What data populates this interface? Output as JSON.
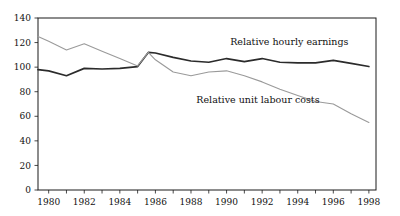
{
  "chart_data": {
    "type": "line",
    "title": "",
    "xlabel": "",
    "ylabel": "",
    "xlim": [
      1979.4,
      1998.4
    ],
    "ylim": [
      0,
      140
    ],
    "grid": false,
    "legend_position": "inline-annotations",
    "yticks": [
      0,
      20,
      40,
      60,
      80,
      100,
      120,
      140
    ],
    "ytick_labels": [
      "0",
      "20",
      "40",
      "60",
      "80",
      "100",
      "120",
      "140"
    ],
    "xticks": [
      1980,
      1981,
      1982,
      1983,
      1984,
      1985,
      1986,
      1987,
      1988,
      1989,
      1990,
      1991,
      1992,
      1993,
      1994,
      1995,
      1996,
      1997,
      1998
    ],
    "xtick_labels_shown": [
      "1980",
      "1982",
      "1984",
      "1986",
      "1988",
      "1990",
      "1992",
      "1994",
      "1996",
      "1998"
    ],
    "x": [
      1979.4,
      1980,
      1981,
      1982,
      1983,
      1984,
      1985,
      1985.6,
      1986,
      1987,
      1988,
      1989,
      1990,
      1991,
      1992,
      1993,
      1994,
      1995,
      1996,
      1997,
      1998
    ],
    "series": [
      {
        "name": "Relative hourly earnings",
        "color": "#2b2b2b",
        "width": 1.7,
        "values": [
          98,
          97,
          93,
          99,
          98.5,
          99,
          100.5,
          112,
          111.5,
          108,
          105,
          104,
          107,
          104.5,
          107,
          104,
          103.5,
          103.5,
          105.5,
          103,
          100.5
        ]
      },
      {
        "name": "Relative unit labour costs",
        "color": "#9a9a9a",
        "width": 1.1,
        "values": [
          125,
          121,
          114,
          119,
          113,
          107,
          101,
          112,
          106,
          96,
          93,
          96,
          97,
          93,
          88,
          82,
          77,
          72,
          70,
          62,
          55
        ]
      }
    ],
    "annotations": [
      {
        "name": "Relative hourly earnings",
        "text": "Relative hourly earnings",
        "x": 1990.2,
        "y": 118
      },
      {
        "name": "Relative unit labour costs",
        "text": "Relative unit labour costs",
        "x": 1988.3,
        "y": 71
      }
    ]
  }
}
